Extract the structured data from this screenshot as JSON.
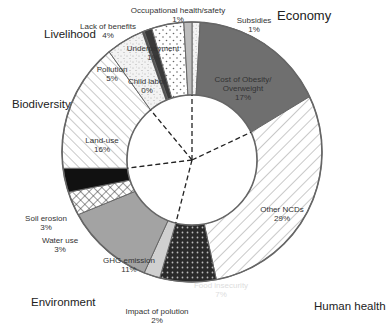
{
  "chart_data": {
    "type": "pie",
    "subtype": "donut",
    "title": "",
    "categories": [
      "Economy",
      "Human health",
      "Environment",
      "Biodiversity",
      "Livelihood"
    ],
    "slices": [
      {
        "label": "Subsidies",
        "value": 1,
        "category": "Economy"
      },
      {
        "label": "Cost of Obesity/ Overweight",
        "value": 17,
        "category": "Economy"
      },
      {
        "label": "Other NCDs",
        "value": 29,
        "category": "Human health"
      },
      {
        "label": "Food insecurity",
        "value": 7,
        "category": "Human health"
      },
      {
        "label": "Impact of polution",
        "value": 2,
        "category": "Environment"
      },
      {
        "label": "GHG emission",
        "value": 11,
        "category": "Environment"
      },
      {
        "label": "Water use",
        "value": 3,
        "category": "Environment"
      },
      {
        "label": "Soil erosion",
        "value": 3,
        "category": "Environment"
      },
      {
        "label": "Land-use",
        "value": 16,
        "category": "Biodiversity"
      },
      {
        "label": "Pollution",
        "value": 5,
        "category": "Livelihood"
      },
      {
        "label": "Child labor",
        "value": 0,
        "category": "Livelihood"
      },
      {
        "label": "Underpayment",
        "value": 1,
        "category": "Livelihood"
      },
      {
        "label": "Lack of benefits",
        "value": 4,
        "category": "Livelihood"
      },
      {
        "label": "Occupational health/safety",
        "value": 1,
        "category": "Livelihood"
      }
    ],
    "unit": "%",
    "start_angle": "12 o'clock",
    "direction": "clockwise",
    "legend": "none (category labels placed around the ring)"
  },
  "labels": {
    "subsidies": {
      "name": "Subsidies",
      "pct": "1%"
    },
    "obesity": {
      "name1": "Cost of Obesity/",
      "name2": "Overweight",
      "pct": "17%"
    },
    "ncds": {
      "name": "Other NCDs",
      "pct": "29%"
    },
    "food": {
      "name": "Food insecurity",
      "pct": "7%"
    },
    "impact": {
      "name": "Impact of polution",
      "pct": "2%"
    },
    "ghg": {
      "name": "GHG emission",
      "pct": "11%"
    },
    "water": {
      "name": "Water use",
      "pct": "3%"
    },
    "soil": {
      "name": "Soil erosion",
      "pct": "3%"
    },
    "land": {
      "name": "Land-use",
      "pct": "16%"
    },
    "pollution": {
      "name": "Pollution",
      "pct": "5%"
    },
    "child": {
      "name": "Child labor",
      "pct": "0%"
    },
    "underpay": {
      "name": "Underpayment",
      "pct": "1%"
    },
    "benefits": {
      "name": "Lack of benefits",
      "pct": "4%"
    },
    "occupational": {
      "name": "Occupational health/safety",
      "pct": "1%"
    }
  },
  "categories": {
    "economy": "Economy",
    "human_health": "Human health",
    "environment": "Environment",
    "biodiversity": "Biodiversity",
    "livelihood": "Livelihood"
  }
}
